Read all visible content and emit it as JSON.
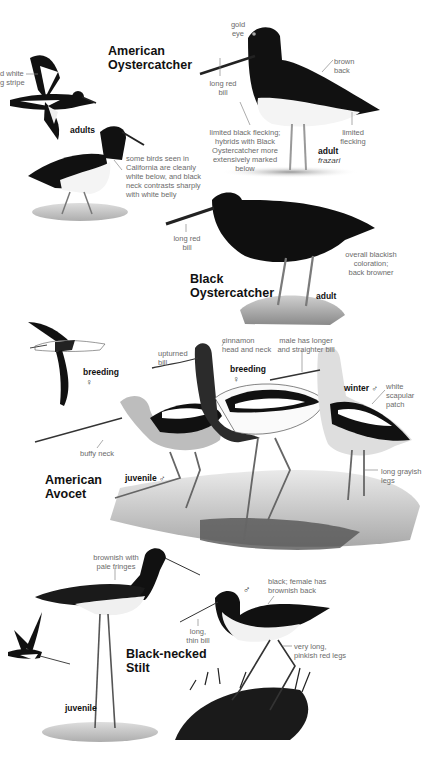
{
  "species": [
    {
      "name_line1": "American",
      "name_line2": "Oystercatcher",
      "labels": {
        "flight_note_line1": "d white",
        "flight_note_line2": "g stripe",
        "adults": "adults",
        "gold_eye_1": "gold",
        "gold_eye_2": "eye",
        "long_red_bill_1": "long red",
        "long_red_bill_2": "bill",
        "brown_back_1": "brown",
        "brown_back_2": "back",
        "flecking_1": "limited black flecking;",
        "flecking_2": "hybrids with Black",
        "flecking_3": "Oystercatcher more",
        "flecking_4": "extensively marked below",
        "limited_flecking_1": "limited",
        "limited_flecking_2": "flecking",
        "adult": "adult",
        "subspecies": "frazari",
        "california_1": "some birds seen in",
        "california_2": "California are cleanly",
        "california_3": "white below, and black",
        "california_4": "neck contrasts sharply",
        "california_5": "with white belly"
      }
    },
    {
      "name_line1": "Black",
      "name_line2": "Oystercatcher",
      "labels": {
        "long_red_bill_1": "long red",
        "long_red_bill_2": "bill",
        "overall_1": "overall blackish",
        "overall_2": "coloration;",
        "overall_3": "back browner",
        "adult": "adult"
      }
    },
    {
      "name_line1": "American",
      "name_line2": "Avocet",
      "labels": {
        "breeding_flight": "breeding",
        "female_symbol": "♀",
        "upturned_1": "upturned",
        "upturned_2": "bill",
        "cinnamon_1": "cinnamon",
        "cinnamon_2": "head and neck",
        "breeding": "breeding",
        "male_bill_1": "male has longer",
        "male_bill_2": "and straighter bill",
        "winter": "winter ♂",
        "scapular_1": "white",
        "scapular_2": "scapular",
        "scapular_3": "patch",
        "buffy_neck": "buffy neck",
        "juvenile": "juvenile ♂",
        "legs_1": "long grayish",
        "legs_2": "legs"
      }
    },
    {
      "name_line1": "Black-necked",
      "name_line2": "Stilt",
      "labels": {
        "brownish_1": "brownish with",
        "brownish_2": "pale fringes",
        "juvenile": "juvenile",
        "male_symbol": "♂",
        "black_back_1": "black; female has",
        "black_back_2": "brownish back",
        "thin_bill_1": "long,",
        "thin_bill_2": "thin bill",
        "legs_1": "very long,",
        "legs_2": "pinkish red legs"
      }
    }
  ],
  "colors": {
    "ink": "#111111",
    "annotation": "#6b6b6b",
    "leader_line": "#888888",
    "background": "#ffffff"
  }
}
